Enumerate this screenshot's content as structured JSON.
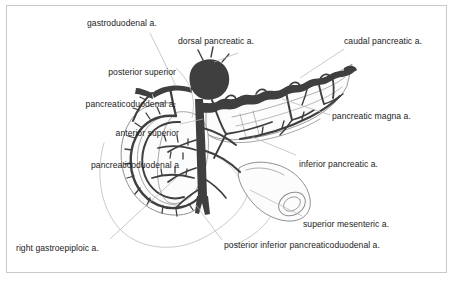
{
  "figure": {
    "width": 455,
    "height": 283,
    "background_color": "#ffffff",
    "border_color": "#c9c9c9",
    "ink_color": "#3b3b3b",
    "outline_color": "#8a8a8a",
    "leader_color": "#b0b0b0",
    "text_color": "#1c1c1c"
  },
  "labels": {
    "gastroduodenal": "gastroduodenal a.",
    "dorsal_pancreatic": "dorsal pancreatic a.",
    "caudal_pancreatic": "caudal pancreatic a.",
    "posterior_superior_pd_line1": "posterior superior",
    "posterior_superior_pd_line2": "pancreaticoduodenal a.",
    "anterior_superior_pd_line1": "anterior superior",
    "anterior_superior_pd_line2": "pancreaticoduodenal a",
    "pancreatic_magna": "pancreatic magna a.",
    "inferior_pancreatic": "inferior pancreatic a.",
    "superior_mesenteric": "superior mesenteric a.",
    "posterior_inferior_pd": "posterior inferior pancreaticoduodenal a.",
    "right_gastroepiploic": "right gastroepiploic a."
  },
  "structures": [
    {
      "name": "duodenum-c-loop",
      "description": "C-shaped duodenal loop, left of center"
    },
    {
      "name": "pancreas-head",
      "description": "pancreatic head within the duodenal curve"
    },
    {
      "name": "pancreas-body-tail",
      "description": "pancreatic body and tail extending to upper right"
    },
    {
      "name": "celiac-trunk-mass",
      "description": "dark rounded vessel origin above pancreas neck"
    },
    {
      "name": "superior-mesenteric-artery-trunk",
      "description": "vertical dark trunk descending in center"
    },
    {
      "name": "splenic-artery",
      "description": "tortuous vessel along superior pancreatic border"
    },
    {
      "name": "jejunum-cut-end",
      "description": "cut tubular bowel segment at lower right"
    },
    {
      "name": "stomach-outline",
      "description": "faint gray curved outline lower left"
    }
  ]
}
